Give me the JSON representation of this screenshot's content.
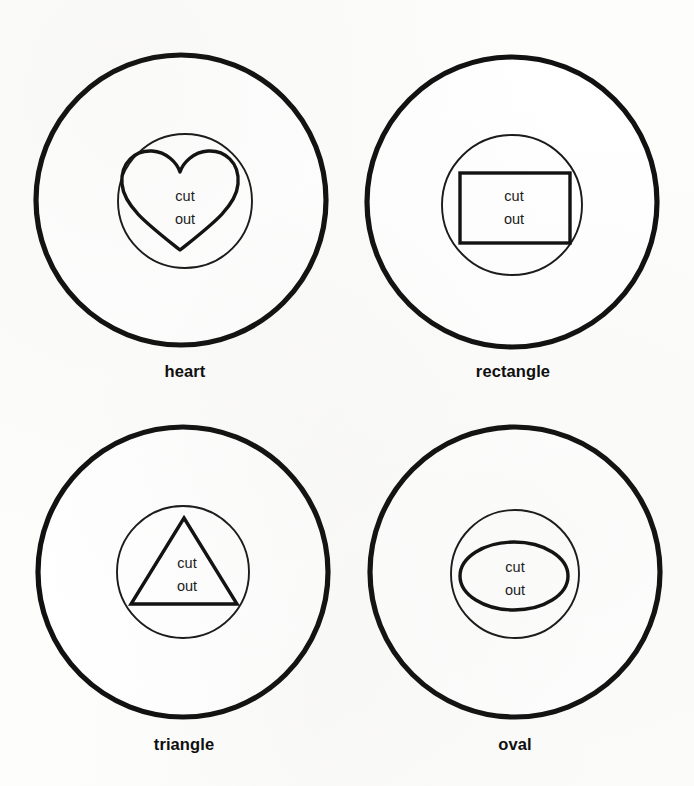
{
  "page": {
    "background_color": "#fdfdfc",
    "ink_color": "#111111",
    "width": 694,
    "height": 786
  },
  "cut_text": {
    "line1": "cut",
    "line2": "out"
  },
  "panels": [
    {
      "id": "heart",
      "label": "heart",
      "shape": "heart",
      "cut_line1": "cut",
      "cut_line2": "out",
      "outer_circle": {
        "cx": 181,
        "cy": 200,
        "r": 145
      },
      "inner_circle": {
        "cx": 185,
        "cy": 201,
        "r": 67
      },
      "label_x": 185,
      "label_y": 377,
      "cut_x": 185,
      "cut_y1": 201,
      "cut_y2": 224
    },
    {
      "id": "rectangle",
      "label": "rectangle",
      "shape": "rectangle",
      "cut_line1": "cut",
      "cut_line2": "out",
      "outer_circle": {
        "cx": 512,
        "cy": 202,
        "r": 145
      },
      "inner_circle": {
        "cx": 512,
        "cy": 205,
        "r": 70
      },
      "rect": {
        "x": 460,
        "y": 173,
        "width": 110,
        "height": 70
      },
      "label_x": 513,
      "label_y": 377,
      "cut_x": 514,
      "cut_y1": 201,
      "cut_y2": 224
    },
    {
      "id": "triangle",
      "label": "triangle",
      "shape": "triangle",
      "cut_line1": "cut",
      "cut_line2": "out",
      "outer_circle": {
        "cx": 183,
        "cy": 572,
        "r": 145
      },
      "inner_circle": {
        "cx": 183,
        "cy": 572,
        "r": 66
      },
      "triangle_points": "184,518 237,604 131,604",
      "label_x": 184,
      "label_y": 750,
      "cut_x": 187,
      "cut_y1": 568,
      "cut_y2": 591
    },
    {
      "id": "oval",
      "label": "oval",
      "shape": "oval",
      "cut_line1": "cut",
      "cut_line2": "out",
      "outer_circle": {
        "cx": 515,
        "cy": 572,
        "r": 145
      },
      "inner_circle": {
        "cx": 515,
        "cy": 574,
        "r": 64
      },
      "ellipse": {
        "cx": 514,
        "cy": 576,
        "rx": 54,
        "ry": 34
      },
      "label_x": 515,
      "label_y": 750,
      "cut_x": 515,
      "cut_y1": 572,
      "cut_y2": 595
    }
  ]
}
